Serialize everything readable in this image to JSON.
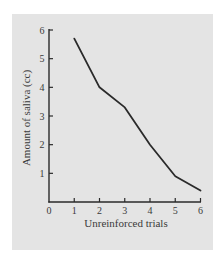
{
  "colors": {
    "background": "#e4e4e4",
    "line": "#2a2a2a",
    "axis": "#2a2a2a",
    "text": "#3a3a3a"
  },
  "chart_data": {
    "type": "line",
    "title": "",
    "xlabel": "Unreinforced trials",
    "ylabel": "Amount of saliva (cc)",
    "x": [
      1,
      2,
      3,
      4,
      5,
      6
    ],
    "series": [
      {
        "name": "Saliva amount",
        "values": [
          5.7,
          4.0,
          3.3,
          2.0,
          0.9,
          0.4
        ]
      }
    ],
    "xticks": [
      "0",
      "1",
      "2",
      "3",
      "4",
      "5",
      "6"
    ],
    "yticks": [
      "1",
      "2",
      "3",
      "4",
      "5",
      "6"
    ],
    "xlim": [
      0,
      6
    ],
    "ylim": [
      0,
      6
    ],
    "grid": false,
    "legend": null
  }
}
